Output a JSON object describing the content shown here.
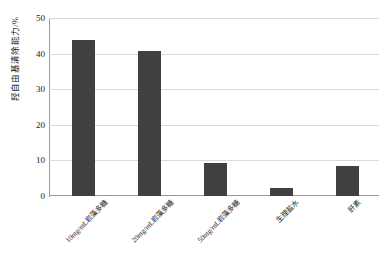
{
  "chart_data": {
    "type": "bar",
    "title": "",
    "xlabel": "",
    "ylabel": "羟自由基清除能力/%",
    "categories": [
      "10mg/mL岩藻多糖",
      "20mg/mL岩藻多糖",
      "50mg/mL岩藻多糖",
      "生理盐水",
      "肝素"
    ],
    "values": [
      44,
      41,
      9.2,
      2.2,
      8.6
    ],
    "ylim": [
      0,
      50
    ],
    "yticks": [
      0,
      10,
      20,
      30,
      40,
      50
    ],
    "ytick_labels": [
      "0",
      "10",
      "20",
      "30",
      "40",
      "50"
    ],
    "grid": true,
    "legend": "none",
    "bar_color": "#404040",
    "grid_color": "#d9d9d9",
    "axis_color": "#9a9a9a",
    "background": "#ffffff"
  }
}
